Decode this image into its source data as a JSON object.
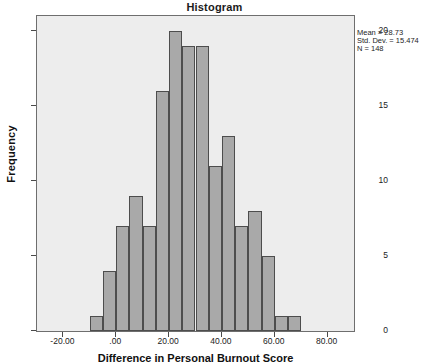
{
  "chart_data": {
    "type": "bar",
    "title": "Histogram",
    "xlabel": "Difference in Personal Burnout Score",
    "ylabel": "Frequency",
    "xlim": [
      -30,
      90
    ],
    "ylim": [
      0,
      21
    ],
    "grid": false,
    "legend_position": "none",
    "bin_width": 5,
    "bin_starts": [
      -10,
      -5,
      0,
      5,
      10,
      15,
      20,
      25,
      30,
      35,
      40,
      45,
      50,
      55,
      60,
      65
    ],
    "bin_centers": [
      -7.5,
      -2.5,
      2.5,
      7.5,
      12.5,
      17.5,
      22.5,
      27.5,
      32.5,
      37.5,
      42.5,
      47.5,
      52.5,
      57.5,
      62.5,
      67.5
    ],
    "values": [
      1,
      4,
      7,
      9,
      7,
      16,
      20,
      19,
      19,
      11,
      13,
      7,
      8,
      5,
      1,
      1
    ],
    "y_ticks": [
      "0",
      "5",
      "10",
      "15",
      "20"
    ],
    "y_tick_values": [
      0,
      5,
      10,
      15,
      20
    ],
    "x_ticks": [
      "-20.00",
      ".00",
      "20.00",
      "40.00",
      "60.00",
      "80.00"
    ],
    "x_tick_values": [
      -20,
      0,
      20,
      40,
      60,
      80
    ],
    "overlay_curve": "normal",
    "bar_color": "#a9a9a9",
    "bar_edge_color": "#4d4d4d",
    "curve_color": "#1a1a1a",
    "plot_background": "#ededed"
  },
  "annotations": {
    "mean_label": "Mean = 28.73",
    "std_dev_label": "Std. Dev. = 15.474",
    "n_label": "N = 148"
  }
}
